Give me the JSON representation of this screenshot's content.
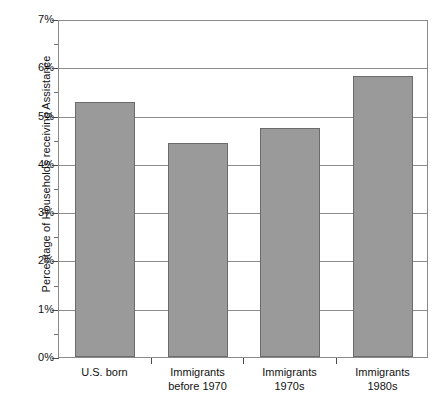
{
  "chart_data": {
    "type": "bar",
    "title": "",
    "xlabel": "",
    "ylabel": "Percentage of Households receiving Assistance",
    "categories": [
      "U.S. born",
      "Immigrants before 1970",
      "Immigrants 1970s",
      "Immigrants 1980s"
    ],
    "category_lines": [
      [
        "U.S. born"
      ],
      [
        "Immigrants",
        "before 1970"
      ],
      [
        "Immigrants",
        "1970s"
      ],
      [
        "Immigrants",
        "1980s"
      ]
    ],
    "values": [
      5.28,
      4.43,
      4.74,
      5.82
    ],
    "value_labels": [
      "5.28%",
      "4.43%",
      "4.74%",
      "5.82%"
    ],
    "ylim": [
      0,
      7
    ],
    "y_major_step": 1,
    "y_minor_step": 0.5,
    "y_tick_labels": [
      "0%",
      "1%",
      "2%",
      "3%",
      "4%",
      "5%",
      "6%",
      "7%"
    ],
    "y_tick_values": [
      0,
      1,
      2,
      3,
      4,
      5,
      6,
      7
    ],
    "grid": true,
    "grid_axis": "y",
    "legend": false,
    "bar_color": "#9a9a9a",
    "bar_border_color": "#6b6b6b",
    "gridline_color": "#8d8d8d",
    "axis_color": "#8a8a8a",
    "background": "#ffffff"
  },
  "caption": {
    "text": ""
  }
}
